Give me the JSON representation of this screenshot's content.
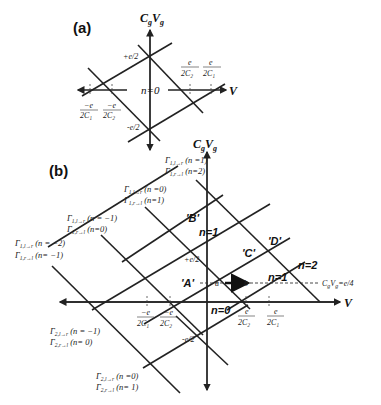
{
  "panel_a": {
    "label": "(a)",
    "y_axis": "C",
    "y_axis_sub": "g",
    "y_axis_2": "V",
    "y_axis_2_sub": "g",
    "x_axis": "V",
    "plus_e2": "+e/2",
    "minus_e2": "-e/2",
    "region": "n=0",
    "ticks_left": [
      {
        "num": "−e",
        "den": "2C₁"
      },
      {
        "num": "−e",
        "den": "2C₂"
      }
    ],
    "ticks_right": [
      {
        "num": "e",
        "den": "2C₂"
      },
      {
        "num": "e",
        "den": "2C₁"
      }
    ]
  },
  "panel_b": {
    "label": "(b)",
    "y_axis": "C",
    "y_axis_sub": "g",
    "y_axis_2": "V",
    "y_axis_2_sub": "g",
    "x_axis": "V",
    "plus_e2": "+e/2",
    "minus_e2": "-e/2",
    "regions": {
      "n1_upper": "n=1",
      "n0": "n=0",
      "n1_right": "n=1",
      "n2": "n=2"
    },
    "points": {
      "A": "'A'",
      "B": "'B'",
      "C": "'C'",
      "D": "'D'",
      "a": "a",
      "b": "b"
    },
    "dashed_line_label": "CₓVₓ=e/4",
    "dashed_label_main": "C",
    "dashed_label_sub1": "g",
    "dashed_label_mid": "V",
    "dashed_label_sub2": "g",
    "dashed_label_end": "=e/4",
    "ticks_left": [
      {
        "num": "−e",
        "den": "2C₁"
      },
      {
        "num": "−e",
        "den": "2C₂"
      }
    ],
    "ticks_right": [
      {
        "num": "e",
        "den": "2C₂"
      },
      {
        "num": "e",
        "den": "2C₁"
      }
    ],
    "gamma_labels": [
      {
        "line1": "Γ1,l→r (n =1)",
        "line2": "Γ1,r→l (n=2)"
      },
      {
        "line1": "Γ1,l→r (n =0)",
        "line2": "Γ1,r→l (n=1)"
      },
      {
        "line1": "Γ1,l→r (n = −1)",
        "line2": "Γ1,r→l (n=0)"
      },
      {
        "line1": "Γ1,l→r (n = −2)",
        "line2": "Γ1,r→l (n= −1)"
      },
      {
        "line1": "Γ2,l→r (n = −1)",
        "line2": "Γ2,r→l (n= 0)"
      },
      {
        "line1": "Γ2,l→r (n =0)",
        "line2": "Γ2,r→l (n= 1)"
      }
    ],
    "gamma_parts": [
      {
        "g": "Γ",
        "s1": "1,l→r",
        "t1": " (n =1)",
        "s2": "1,r→l",
        "t2": " (n=2)"
      },
      {
        "g": "Γ",
        "s1": "1,l→r",
        "t1": " (n =0)",
        "s2": "1,r→l",
        "t2": " (n=1)"
      },
      {
        "g": "Γ",
        "s1": "1,l→r",
        "t1": " (n = −1)",
        "s2": "1,r→l",
        "t2": " (n=0)"
      },
      {
        "g": "Γ",
        "s1": "1,l→r",
        "t1": " (n = −2)",
        "s2": "1,r→l",
        "t2": " (n= −1)"
      },
      {
        "g": "Γ",
        "s1": "2,l→r",
        "t1": " (n = −1)",
        "s2": "2,r→l",
        "t2": " (n= 0)"
      },
      {
        "g": "Γ",
        "s1": "2,l→r",
        "t1": " (n =0)",
        "s2": "2,r→l",
        "t2": " (n= 1)"
      }
    ]
  }
}
